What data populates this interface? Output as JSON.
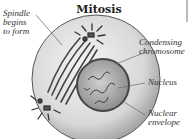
{
  "title": "Mitosis",
  "labels": {
    "spindle": [
      "Spindle",
      "begins",
      "to form"
    ],
    "condensing": [
      "Condensing",
      "chromosome"
    ],
    "nucleus": "Nucleus",
    "envelope": [
      "Nuclear",
      "envelope"
    ]
  }
}
